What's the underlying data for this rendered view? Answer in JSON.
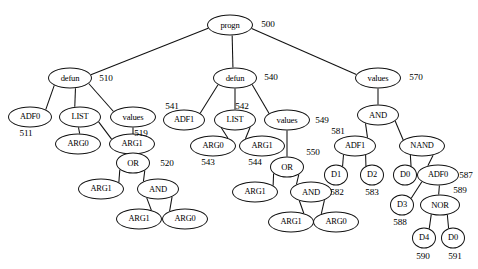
{
  "figure": {
    "kind": "tree-diagram",
    "background_color": "#ffffff",
    "stroke_color": "#111111",
    "text_color": "#000000"
  },
  "nodes": [
    {
      "id": "n500",
      "label": "progn",
      "x": 230,
      "y": 25,
      "rx": 23,
      "ry": 10.5,
      "fs": 8.6
    },
    {
      "id": "n510",
      "label": "defun",
      "x": 70,
      "y": 78,
      "rx": 22,
      "ry": 10.5,
      "fs": 8.6
    },
    {
      "id": "n540",
      "label": "defun",
      "x": 235,
      "y": 78,
      "rx": 22,
      "ry": 10.5,
      "fs": 8.6
    },
    {
      "id": "n570",
      "label": "values",
      "x": 378,
      "y": 78,
      "rx": 23,
      "ry": 10.5,
      "fs": 8.6
    },
    {
      "id": "n511",
      "label": "ADF0",
      "x": 30,
      "y": 117,
      "rx": 22,
      "ry": 10.5,
      "fs": 8.4
    },
    {
      "id": "nLIST1",
      "label": "LIST",
      "x": 80,
      "y": 117,
      "rx": 21,
      "ry": 10.5,
      "fs": 8.4
    },
    {
      "id": "n519",
      "label": "values",
      "x": 133,
      "y": 117,
      "rx": 23,
      "ry": 10.5,
      "fs": 8.6
    },
    {
      "id": "nARG0a",
      "label": "ARG0",
      "x": 78,
      "y": 144,
      "rx": 23,
      "ry": 10.5,
      "fs": 8.4
    },
    {
      "id": "nARG1a",
      "label": "ARG1",
      "x": 132,
      "y": 144,
      "rx": 23,
      "ry": 10.5,
      "fs": 8.4
    },
    {
      "id": "n520",
      "label": "OR",
      "x": 133,
      "y": 163,
      "rx": 17,
      "ry": 10.5,
      "fs": 8.6
    },
    {
      "id": "nARG1b",
      "label": "ARG1",
      "x": 101,
      "y": 189,
      "rx": 23,
      "ry": 10.5,
      "fs": 8.4
    },
    {
      "id": "nANDa",
      "label": "AND",
      "x": 158,
      "y": 189,
      "rx": 21,
      "ry": 10.5,
      "fs": 8.6
    },
    {
      "id": "nARG1c",
      "label": "ARG1",
      "x": 139,
      "y": 219,
      "rx": 23,
      "ry": 10.5,
      "fs": 8.4
    },
    {
      "id": "nARG0b",
      "label": "ARG0",
      "x": 185,
      "y": 219,
      "rx": 23,
      "ry": 10.5,
      "fs": 8.4
    },
    {
      "id": "n541",
      "label": "ADF1",
      "x": 184,
      "y": 120,
      "rx": 21,
      "ry": 10.5,
      "fs": 8.4
    },
    {
      "id": "nLIST2",
      "label": "LIST",
      "x": 235,
      "y": 120,
      "rx": 21,
      "ry": 10.5,
      "fs": 8.4
    },
    {
      "id": "n549",
      "label": "values",
      "x": 287,
      "y": 120,
      "rx": 23,
      "ry": 10.5,
      "fs": 8.6
    },
    {
      "id": "nARG0c",
      "label": "ARG0",
      "x": 213,
      "y": 146,
      "rx": 23,
      "ry": 10.5,
      "fs": 8.4
    },
    {
      "id": "nARG1d",
      "label": "ARG1",
      "x": 262,
      "y": 146,
      "rx": 23,
      "ry": 10.5,
      "fs": 8.4
    },
    {
      "id": "n550",
      "label": "OR",
      "x": 287,
      "y": 167,
      "rx": 17,
      "ry": 10.5,
      "fs": 8.6
    },
    {
      "id": "nARG1e",
      "label": "ARG1",
      "x": 255,
      "y": 192,
      "rx": 23,
      "ry": 10.5,
      "fs": 8.4
    },
    {
      "id": "nANDb",
      "label": "AND",
      "x": 311,
      "y": 192,
      "rx": 21,
      "ry": 10.5,
      "fs": 8.6
    },
    {
      "id": "nARG1f",
      "label": "ARG1",
      "x": 291,
      "y": 222,
      "rx": 23,
      "ry": 10.5,
      "fs": 8.4
    },
    {
      "id": "nARG0d",
      "label": "ARG0",
      "x": 336,
      "y": 222,
      "rx": 23,
      "ry": 10.5,
      "fs": 8.4
    },
    {
      "id": "nANDc",
      "label": "AND",
      "x": 378,
      "y": 115,
      "rx": 21,
      "ry": 10.5,
      "fs": 8.6
    },
    {
      "id": "n581",
      "label": "ADF1",
      "x": 355,
      "y": 146,
      "rx": 21,
      "ry": 10.5,
      "fs": 8.4
    },
    {
      "id": "nNAND",
      "label": "NAND",
      "x": 422,
      "y": 146,
      "rx": 23,
      "ry": 10.5,
      "fs": 8.4
    },
    {
      "id": "n582",
      "label": "D1",
      "x": 336,
      "y": 175,
      "rx": 12,
      "ry": 10.5,
      "fs": 8.4
    },
    {
      "id": "n583",
      "label": "D2",
      "x": 372,
      "y": 175,
      "rx": 12,
      "ry": 10.5,
      "fs": 8.4
    },
    {
      "id": "nD0a",
      "label": "D0",
      "x": 405,
      "y": 175,
      "rx": 12,
      "ry": 10.5,
      "fs": 8.4
    },
    {
      "id": "n587",
      "label": "ADF0",
      "x": 438,
      "y": 175,
      "rx": 21,
      "ry": 10.5,
      "fs": 8.4
    },
    {
      "id": "n588",
      "label": "D3",
      "x": 402,
      "y": 205,
      "rx": 12,
      "ry": 10.5,
      "fs": 8.4
    },
    {
      "id": "n589",
      "label": "NOR",
      "x": 440,
      "y": 205,
      "rx": 20,
      "ry": 10.5,
      "fs": 8.6
    },
    {
      "id": "n590",
      "label": "D4",
      "x": 424,
      "y": 238,
      "rx": 12,
      "ry": 10.5,
      "fs": 8.4
    },
    {
      "id": "n591",
      "label": "D0",
      "x": 453,
      "y": 238,
      "rx": 12,
      "ry": 10.5,
      "fs": 8.4
    }
  ],
  "edges": [
    {
      "from": "n500",
      "to": "n510"
    },
    {
      "from": "n500",
      "to": "n540"
    },
    {
      "from": "n500",
      "to": "n570"
    },
    {
      "from": "n510",
      "to": "n511"
    },
    {
      "from": "n510",
      "to": "nLIST1"
    },
    {
      "from": "n510",
      "to": "n519"
    },
    {
      "from": "nLIST1",
      "to": "nARG0a"
    },
    {
      "from": "nLIST1",
      "to": "nARG1a"
    },
    {
      "from": "n519",
      "to": "n520"
    },
    {
      "from": "n520",
      "to": "nARG1b"
    },
    {
      "from": "n520",
      "to": "nANDa"
    },
    {
      "from": "nANDa",
      "to": "nARG1c"
    },
    {
      "from": "nANDa",
      "to": "nARG0b"
    },
    {
      "from": "n540",
      "to": "n541"
    },
    {
      "from": "n540",
      "to": "nLIST2"
    },
    {
      "from": "n540",
      "to": "n549"
    },
    {
      "from": "nLIST2",
      "to": "nARG0c"
    },
    {
      "from": "nLIST2",
      "to": "nARG1d"
    },
    {
      "from": "n549",
      "to": "n550"
    },
    {
      "from": "n550",
      "to": "nARG1e"
    },
    {
      "from": "n550",
      "to": "nANDb"
    },
    {
      "from": "nANDb",
      "to": "nARG1f"
    },
    {
      "from": "nANDb",
      "to": "nARG0d"
    },
    {
      "from": "n570",
      "to": "nANDc"
    },
    {
      "from": "nANDc",
      "to": "n581"
    },
    {
      "from": "nANDc",
      "to": "nNAND"
    },
    {
      "from": "n581",
      "to": "n582"
    },
    {
      "from": "n581",
      "to": "n583"
    },
    {
      "from": "nNAND",
      "to": "nD0a"
    },
    {
      "from": "nNAND",
      "to": "n587"
    },
    {
      "from": "n587",
      "to": "n588"
    },
    {
      "from": "n587",
      "to": "n589"
    },
    {
      "from": "n589",
      "to": "n590"
    },
    {
      "from": "n589",
      "to": "n591"
    }
  ],
  "tags": [
    {
      "id": "t500",
      "text": "500",
      "x": 268,
      "y": 24,
      "fs": 9.2
    },
    {
      "id": "t510",
      "text": "510",
      "x": 106,
      "y": 78,
      "fs": 9.2
    },
    {
      "id": "t540",
      "text": "540",
      "x": 271,
      "y": 77,
      "fs": 9.2
    },
    {
      "id": "t570",
      "text": "570",
      "x": 416,
      "y": 77,
      "fs": 9.2
    },
    {
      "id": "t511",
      "text": "511",
      "x": 26,
      "y": 133,
      "fs": 9.2
    },
    {
      "id": "t519",
      "text": "519",
      "x": 141,
      "y": 133,
      "fs": 9.2
    },
    {
      "id": "t520",
      "text": "520",
      "x": 167,
      "y": 163,
      "fs": 9.2
    },
    {
      "id": "t541",
      "text": "541",
      "x": 172,
      "y": 106,
      "fs": 9.2
    },
    {
      "id": "t542",
      "text": "542",
      "x": 242,
      "y": 106,
      "fs": 9.2
    },
    {
      "id": "t549",
      "text": "549",
      "x": 322,
      "y": 120,
      "fs": 9.2
    },
    {
      "id": "t543",
      "text": "543",
      "x": 208,
      "y": 162,
      "fs": 9.2
    },
    {
      "id": "t544",
      "text": "544",
      "x": 255,
      "y": 162,
      "fs": 9.2
    },
    {
      "id": "t550",
      "text": "550",
      "x": 313,
      "y": 152,
      "fs": 9.2
    },
    {
      "id": "t581",
      "text": "581",
      "x": 338,
      "y": 131,
      "fs": 9.2
    },
    {
      "id": "t582",
      "text": "582",
      "x": 337,
      "y": 192,
      "fs": 9.2
    },
    {
      "id": "t583",
      "text": "583",
      "x": 372,
      "y": 192,
      "fs": 9.2
    },
    {
      "id": "t587",
      "text": "587",
      "x": 466,
      "y": 175,
      "fs": 9.2
    },
    {
      "id": "t589",
      "text": "589",
      "x": 460,
      "y": 190,
      "fs": 9.2
    },
    {
      "id": "t588",
      "text": "588",
      "x": 400,
      "y": 222,
      "fs": 9.2
    },
    {
      "id": "t590",
      "text": "590",
      "x": 423,
      "y": 256,
      "fs": 9.2
    },
    {
      "id": "t591",
      "text": "591",
      "x": 455,
      "y": 256,
      "fs": 9.2
    }
  ]
}
